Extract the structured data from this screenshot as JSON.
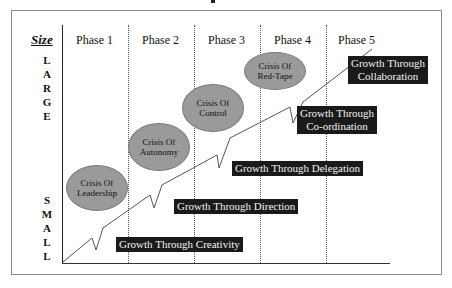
{
  "diagram": {
    "y_axis": {
      "title": "Size",
      "top_label": [
        "L",
        "A",
        "R",
        "G",
        "E"
      ],
      "bottom_label": [
        "S",
        "M",
        "A",
        "L",
        "L"
      ]
    },
    "phases": [
      "Phase 1",
      "Phase 2",
      "Phase 3",
      "Phase 4",
      "Phase 5"
    ],
    "crises": [
      {
        "line1": "Crisis Of",
        "line2": "Leadership"
      },
      {
        "line1": "Crisis Of",
        "line2": "Autonomy"
      },
      {
        "line1": "Crisis Of",
        "line2": "Control"
      },
      {
        "line1": "Crisis Of",
        "line2": "Red-Tape"
      }
    ],
    "growth_stages": [
      {
        "line1": "Growth Through Creativity",
        "line2": ""
      },
      {
        "line1": "Growth Through Direction",
        "line2": ""
      },
      {
        "line1": "Growth Through Delegation",
        "line2": ""
      },
      {
        "line1": "Growth Through",
        "line2": "Co-ordination"
      },
      {
        "line1": "Growth Through",
        "line2": "Collaboration"
      }
    ],
    "colors": {
      "crisis_fill": "#9a9a9a",
      "growth_fill": "#1a1a1a",
      "growth_text": "#f2f2f2",
      "line": "#555555"
    }
  }
}
